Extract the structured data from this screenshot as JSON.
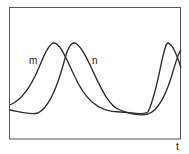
{
  "diagram": {
    "type": "oscillation-curves",
    "labels": {
      "curve_m": "m",
      "curve_n": "n",
      "x_axis": "t"
    },
    "colors": {
      "stroke": "#2a2a2a",
      "frame": "#555555",
      "background": "#ffffff"
    }
  }
}
